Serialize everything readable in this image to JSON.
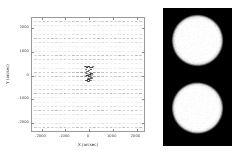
{
  "figure": {
    "panels": [
      "vector-field-plot",
      "intensity-image"
    ],
    "background_color": "#ffffff"
  },
  "left_panel": {
    "axes": {
      "frame_color": "#9a9a9a",
      "tick_color": "#8c8c8c",
      "xlabel": "X (arcsec)",
      "ylabel": "Y (arcsec)",
      "xticks": [
        "-2000",
        "-1000",
        "0",
        "1000",
        "2000"
      ],
      "yticks": [
        "2000",
        "1000",
        "0",
        "-1000",
        "-2000"
      ],
      "xlim": [
        -2400,
        2400
      ],
      "ylim": [
        -2400,
        2400
      ],
      "grid": false
    },
    "marker_color_light": "#c8c8c8",
    "marker_color_dark": "#3a3a3a"
  },
  "right_panel": {
    "background_color": "#000000",
    "blob_color": "#ffffff",
    "blobs": [
      {
        "cx": 0.5,
        "cy": 0.235,
        "r": 0.36,
        "label": "upper-disk"
      },
      {
        "cx": 0.5,
        "cy": 0.725,
        "r": 0.36,
        "label": "lower-disk"
      }
    ]
  },
  "chart_data": {
    "type": "scatter",
    "title": "",
    "xlabel": "X (arcsec)",
    "ylabel": "Y (arcsec)",
    "xlim": [
      -2400,
      2400
    ],
    "ylim": [
      -2400,
      2400
    ],
    "xticks": [
      -2000,
      -1000,
      0,
      1000,
      2000
    ],
    "yticks": [
      -2000,
      -1000,
      0,
      1000,
      2000
    ],
    "grid": false,
    "legend": null,
    "series": [
      {
        "name": "grid-markers",
        "marker": "horizontal-dash",
        "color": "#c8c8c8",
        "nx": 26,
        "ny": 26,
        "x_start": -2250,
        "x_step": 180,
        "y_start": -2250,
        "y_step": 180
      },
      {
        "name": "central-cluster",
        "marker": "dash",
        "color": "#3a3a3a",
        "x": [
          -110,
          -40,
          30,
          95,
          160,
          215,
          -70,
          10,
          85,
          150,
          -30,
          40,
          110,
          180,
          0,
          70,
          140,
          -60,
          20,
          100
        ],
        "y": [
          330,
          300,
          345,
          310,
          290,
          325,
          60,
          20,
          -10,
          45,
          -40,
          -80,
          -60,
          -20,
          -150,
          -185,
          -140,
          -250,
          -215,
          -240
        ]
      }
    ]
  },
  "right_chart_data": {
    "type": "heatmap",
    "title": "",
    "colormap": "gray",
    "vmin": 0,
    "vmax": 1,
    "description": "Two bright, circular, soft-edged solar disks on a black background, stacked vertically and nearly identical in size."
  }
}
